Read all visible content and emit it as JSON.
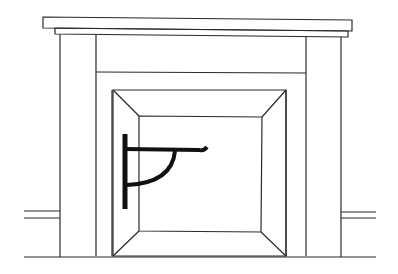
{
  "image": {
    "subject": "fireplace line drawing",
    "elements": [
      "mantel-shelf",
      "mantel-frieze",
      "pilasters",
      "firebox-opening",
      "crane-bracket",
      "baseboard",
      "floor-line"
    ]
  },
  "colors": {
    "background": "#ffffff",
    "line": "#2a2a2a",
    "bracket": "#111111"
  }
}
